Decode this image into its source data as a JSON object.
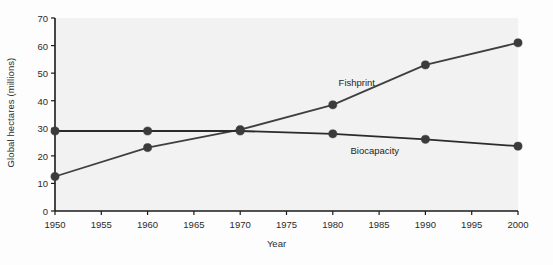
{
  "chart_data": {
    "type": "line",
    "title": "",
    "xlabel": "Year",
    "ylabel": "Global hectares (millions)",
    "x": [
      1950,
      1960,
      1970,
      1980,
      1990,
      2000
    ],
    "xlim": [
      1950,
      2000
    ],
    "ylim": [
      0,
      70
    ],
    "xticks": [
      1950,
      1955,
      1960,
      1965,
      1970,
      1975,
      1980,
      1985,
      1990,
      1995,
      2000
    ],
    "xtick_labels": [
      "1950",
      "1955",
      "1960",
      "1965",
      "1970",
      "1975",
      "1980",
      "1985",
      "1990",
      "1995",
      "2000"
    ],
    "yticks": [
      0,
      10,
      20,
      30,
      40,
      50,
      60,
      70
    ],
    "ytick_labels": [
      "0",
      "10",
      "20",
      "30",
      "40",
      "50",
      "60",
      "70"
    ],
    "grid": false,
    "legend_position": "inline-annotations",
    "series": [
      {
        "name": "Fishprint",
        "values": [
          12.5,
          23,
          29.5,
          38.5,
          53,
          61
        ],
        "color": "#3f3f3f",
        "marker": "circle",
        "label_x": 1983,
        "label_y": 46
      },
      {
        "name": "Biocapacity",
        "values": [
          29,
          29,
          29,
          28,
          26,
          23.5
        ],
        "color": "#2b2b2b",
        "marker": "circle",
        "label_x": 1984.5,
        "label_y": 21.5
      }
    ]
  },
  "annotations": {
    "fishprint_label": "Fishprint",
    "biocapacity_label": "Biocapacity"
  },
  "axes": {
    "x_title": "Year",
    "y_title": "Global hectares (millions)"
  },
  "style": {
    "plot_background": "#f2f2f2",
    "axis_color": "#1a1a1a",
    "line_color": "#3f3f3f",
    "marker_color": "#3b3b3b",
    "page_background": "#fdfdfd"
  }
}
